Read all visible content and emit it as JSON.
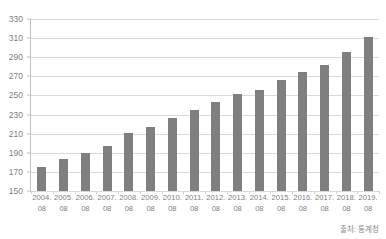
{
  "chart_data": {
    "type": "bar",
    "title": "",
    "xlabel": "",
    "ylabel": "",
    "ylim": [
      150,
      330
    ],
    "ytick_step": 20,
    "yticks": [
      330,
      310,
      290,
      270,
      250,
      230,
      210,
      190,
      170,
      150
    ],
    "grid": true,
    "legend": null,
    "bar_color": "#7f7f7f",
    "grid_color": "#d9d9d9",
    "axis_color": "#bfbfbf",
    "tick_label_color": "#808080",
    "categories": [
      "2004. 08",
      "2005. 08",
      "2006. 08",
      "2007. 08",
      "2008. 08",
      "2009. 08",
      "2010. 08",
      "2011. 08",
      "2012. 08",
      "2013. 08",
      "2014. 08",
      "2015. 08",
      "2016. 08",
      "2017. 08",
      "2018. 08",
      "2019. 08"
    ],
    "category_lines": [
      [
        "2004.",
        "08"
      ],
      [
        "2005.",
        "08"
      ],
      [
        "2006.",
        "08"
      ],
      [
        "2007.",
        "08"
      ],
      [
        "2008.",
        "08"
      ],
      [
        "2009.",
        "08"
      ],
      [
        "2010.",
        "08"
      ],
      [
        "2011.",
        "08"
      ],
      [
        "2012.",
        "08"
      ],
      [
        "2013.",
        "08"
      ],
      [
        "2014.",
        "08"
      ],
      [
        "2015.",
        "08"
      ],
      [
        "2016.",
        "08"
      ],
      [
        "2017.",
        "08"
      ],
      [
        "2018.",
        "08"
      ],
      [
        "2019.",
        "08"
      ]
    ],
    "values": [
      175,
      183,
      190,
      197,
      211,
      217,
      226,
      235,
      243,
      252,
      256,
      266,
      275,
      282,
      295,
      311
    ]
  },
  "footer": {
    "source_note": "출처: 통계청"
  }
}
